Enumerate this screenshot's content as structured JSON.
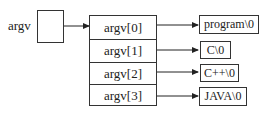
{
  "diagram": {
    "pointer_label": "argv",
    "array_cells": [
      "argv[0]",
      "argv[1]",
      "argv[2]",
      "argv[3]"
    ],
    "strings": [
      "program\\0",
      "C\\0",
      "C++\\0",
      "JAVA\\0"
    ]
  }
}
